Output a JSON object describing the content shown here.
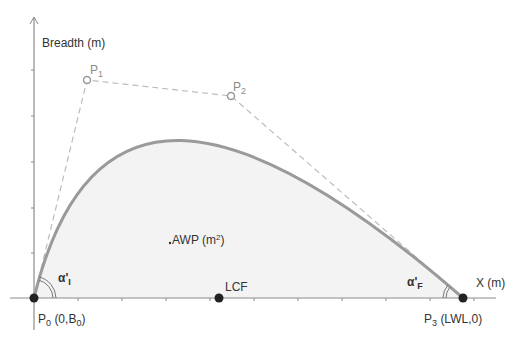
{
  "diagram": {
    "type": "bezier-waterplane-curve",
    "colors": {
      "axis": "#8c8c8c",
      "curve": "#9a9a9a",
      "fill": "#f2f2f2",
      "control_polygon": "#b8b8b8",
      "point_fill": "#222222",
      "text": "#333333",
      "control_label": "#999999"
    },
    "axes": {
      "y_label": "Breadth (m)",
      "x_label": "X (m)"
    },
    "points": {
      "p0": {
        "name": "P",
        "sub": "0",
        "coord": "(0,B",
        "coord_sub": "0",
        "coord_end": ")"
      },
      "p1": {
        "name": "P",
        "sub": "1"
      },
      "p2": {
        "name": "P",
        "sub": "2"
      },
      "p3": {
        "name": "P",
        "sub": "3",
        "coord": "(LWL,0)"
      },
      "lcf": {
        "label": "LCF"
      }
    },
    "area": {
      "label": "AWP (m",
      "sup": "2",
      "end": ")"
    },
    "angles": {
      "initial": {
        "symbol": "α'",
        "sub": "I"
      },
      "final": {
        "symbol": "α'",
        "sub": "F"
      }
    }
  }
}
